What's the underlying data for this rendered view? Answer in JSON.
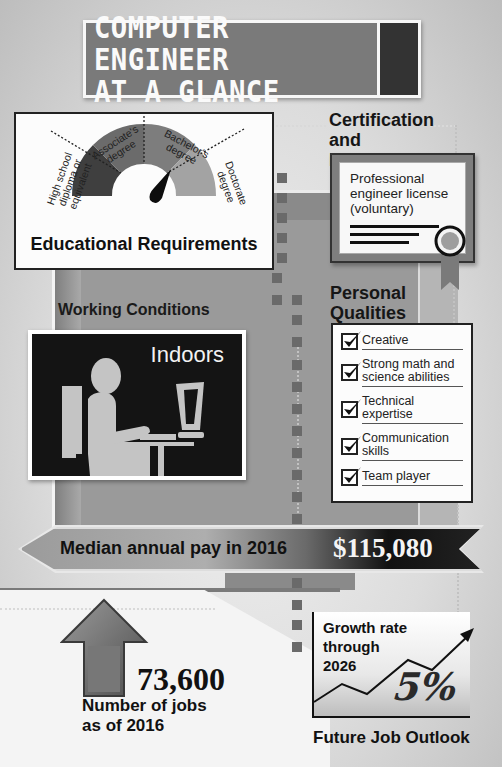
{
  "title": {
    "text": "COMPUTER ENGINEER\nAT A GLANCE"
  },
  "education": {
    "heading": "Educational Requirements",
    "levels": [
      {
        "label": "High school diploma or equivalent",
        "color": "#3f3f3f"
      },
      {
        "label": "Associate's degree",
        "color": "#6b6b6b"
      },
      {
        "label": "Bachelor's degree",
        "color": "#7d7d7d"
      },
      {
        "label": "Doctorate degree",
        "color": "#a3a3a3"
      }
    ],
    "gauge_pointer": "Bachelor's degree"
  },
  "certification": {
    "heading": "Certification and Licensing",
    "document_text": "Professional engineer license (voluntary)"
  },
  "working_conditions": {
    "heading": "Working Conditions",
    "value": "Indoors"
  },
  "personal_qualities": {
    "heading": "Personal Qualities",
    "items": [
      {
        "label": "Creative",
        "checked": true
      },
      {
        "label": "Strong math and science abilities",
        "checked": true
      },
      {
        "label": "Technical expertise",
        "checked": true
      },
      {
        "label": "Communication skills",
        "checked": true
      },
      {
        "label": "Team player",
        "checked": true
      }
    ]
  },
  "pay": {
    "label": "Median annual pay in 2016",
    "value": "$115,080"
  },
  "jobs": {
    "value": "73,600",
    "label": "Number of jobs as of 2016"
  },
  "outlook": {
    "chart_text": "Growth rate through 2026",
    "value": "5%",
    "label": "Future Job Outlook"
  }
}
